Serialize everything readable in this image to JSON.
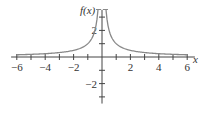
{
  "chart_data": {
    "type": "line",
    "title": "",
    "xlabel": "x",
    "ylabel": "f(x)",
    "function": "f(x) = 1/|x|",
    "xlim": [
      -6.4,
      6.4
    ],
    "ylim": [
      -3.5,
      3.7
    ],
    "x_ticks": [
      -6,
      -5,
      -4,
      -3,
      -2,
      -1,
      1,
      2,
      3,
      4,
      5,
      6
    ],
    "x_tick_labels": [
      "-6",
      "-4",
      "-2",
      "2",
      "4",
      "6"
    ],
    "x_tick_label_values": [
      -6,
      -4,
      -2,
      2,
      4,
      6
    ],
    "y_ticks": [
      -3,
      -2,
      -1,
      1,
      2,
      3
    ],
    "y_tick_labels": [
      "2",
      "-2"
    ],
    "y_tick_label_values": [
      2,
      -2
    ],
    "grid": false,
    "legend": null,
    "series": [
      {
        "name": "f(x) left branch",
        "x": [
          -6,
          -5,
          -4,
          -3,
          -2,
          -1.5,
          -1,
          -0.75,
          -0.5,
          -0.4,
          -0.3
        ],
        "values": [
          0.17,
          0.2,
          0.25,
          0.33,
          0.5,
          0.67,
          1.0,
          1.33,
          2.0,
          2.5,
          3.33
        ]
      },
      {
        "name": "f(x) right branch",
        "x": [
          0.3,
          0.4,
          0.5,
          0.75,
          1,
          1.5,
          2,
          3,
          4,
          5,
          6
        ],
        "values": [
          3.33,
          2.5,
          2.0,
          1.33,
          1.0,
          0.67,
          0.5,
          0.33,
          0.25,
          0.2,
          0.17
        ]
      }
    ],
    "colors": {
      "curve": "#888888",
      "axes": "#444444",
      "text": "#333333"
    }
  },
  "labels": {
    "x_axis": "x",
    "y_axis": "f(x)"
  }
}
